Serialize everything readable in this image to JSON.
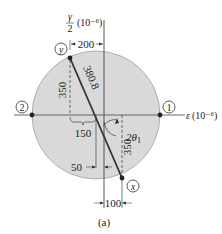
{
  "figure": {
    "caption": "(a)",
    "axes": {
      "horizontal_label": "ε (10⁻⁶)",
      "horizontal_symbol": "ε",
      "horizontal_unit": "(10⁻⁶)",
      "vertical_label_num": "γ",
      "vertical_label_den": "2",
      "vertical_unit": "(10⁻⁶)"
    },
    "points": {
      "y": "y",
      "x": "x",
      "p1": "1",
      "p2": "2"
    },
    "dimensions": {
      "top_offset": "200",
      "radius": "380.8",
      "y_left_height": "350",
      "center_offset": "150",
      "x_right_height": "350",
      "small_offset": "50",
      "bottom_offset": "100"
    },
    "angle_label": "2θ",
    "angle_subscript": "1"
  },
  "colors": {
    "circle_fill": "#d9d9d9",
    "circle_stroke": "#9a9a9a",
    "line": "#333333",
    "axis": "#555555",
    "text": "#222222"
  }
}
